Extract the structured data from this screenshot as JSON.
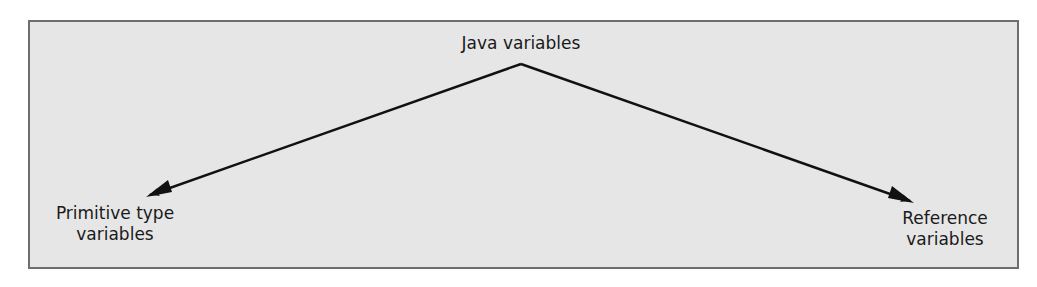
{
  "diagram": {
    "root": {
      "label": "Java variables"
    },
    "children": [
      {
        "line1": "Primitive type",
        "line2": "variables"
      },
      {
        "line1": "Reference",
        "line2": "variables"
      }
    ],
    "colors": {
      "background": "#e6e6e6",
      "border": "#6e6e6e",
      "arrow": "#111111",
      "text": "#1a1a1a"
    }
  }
}
